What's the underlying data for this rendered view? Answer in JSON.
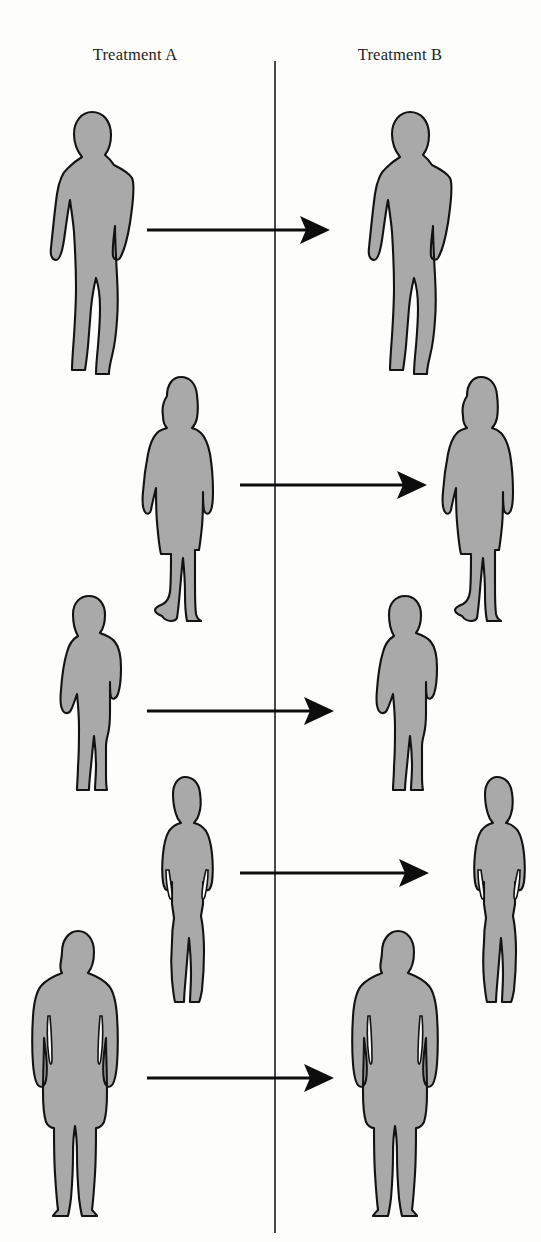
{
  "figure": {
    "type": "diagram",
    "background_color": "#fdfdfc",
    "silhouette_fill": "#a9a9a9",
    "silhouette_outline": "#121212",
    "divider_color": "#4a4a4a",
    "arrow_color": "#0d0d0d",
    "width": 541,
    "height": 1242
  },
  "columns": [
    {
      "id": "treatment-a",
      "label": "Treatment A",
      "center_x": 135
    },
    {
      "id": "treatment-b",
      "label": "Treatment B",
      "center_x": 400
    }
  ],
  "divider": {
    "x": 275,
    "y_top": 61,
    "y_bottom": 1233
  },
  "subjects": [
    {
      "index": 1,
      "silhouette": "standing-man-hands-in-pockets",
      "sex": "male",
      "row_y": 230,
      "a_x": 30,
      "b_x": 348,
      "top": 108,
      "height": 266
    },
    {
      "index": 2,
      "silhouette": "standing-woman-bob-haircut-skirt",
      "sex": "female",
      "row_y": 485,
      "a_x": 139,
      "b_x": 439,
      "top": 374,
      "height": 248
    },
    {
      "index": 3,
      "silhouette": "standing-man-jacket",
      "sex": "male",
      "row_y": 711,
      "a_x": 33,
      "b_x": 349,
      "top": 594,
      "height": 198
    },
    {
      "index": 4,
      "silhouette": "standing-woman-arms-at-sides",
      "sex": "female",
      "row_y": 873,
      "a_x": 153,
      "b_x": 465,
      "top": 774,
      "height": 228
    },
    {
      "index": 5,
      "silhouette": "standing-man-front-facing",
      "sex": "male",
      "row_y": 1078,
      "a_x": 26,
      "b_x": 346,
      "top": 928,
      "height": 294
    }
  ],
  "arrows": [
    {
      "index": 1,
      "from_x": 147,
      "to_x": 327,
      "y": 230,
      "direction": "right"
    },
    {
      "index": 2,
      "from_x": 240,
      "to_x": 424,
      "y": 485,
      "direction": "right"
    },
    {
      "index": 3,
      "from_x": 147,
      "to_x": 331,
      "y": 711,
      "direction": "right"
    },
    {
      "index": 4,
      "from_x": 240,
      "to_x": 426,
      "y": 873,
      "direction": "right"
    },
    {
      "index": 5,
      "from_x": 147,
      "to_x": 331,
      "y": 1078,
      "direction": "right"
    }
  ]
}
